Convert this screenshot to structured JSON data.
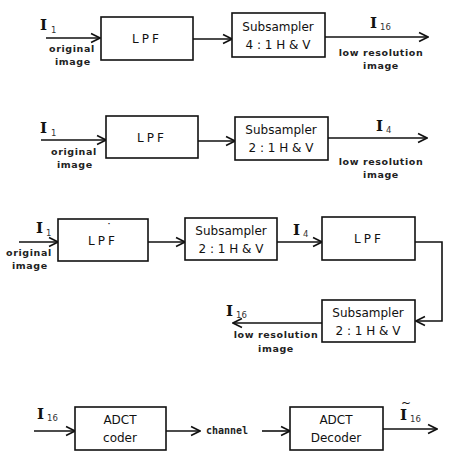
{
  "figure": {
    "rows": [
      {
        "id": "pipeline-4to1",
        "input": {
          "symbol": "I",
          "subscript": "1",
          "caption_line1": "original",
          "caption_line2": "image"
        },
        "blocks": [
          {
            "id": "lpf",
            "line1": "LPF"
          },
          {
            "id": "subsampler",
            "line1": "Subsampler",
            "line2": "4 : 1 H & V"
          }
        ],
        "output": {
          "symbol": "I",
          "subscript": "16",
          "caption_line1": "low resolution",
          "caption_line2": "image"
        }
      },
      {
        "id": "pipeline-2to1",
        "input": {
          "symbol": "I",
          "subscript": "1",
          "caption_line1": "original",
          "caption_line2": "image"
        },
        "blocks": [
          {
            "id": "lpf",
            "line1": "LPF"
          },
          {
            "id": "subsampler",
            "line1": "Subsampler",
            "line2": "2 : 1 H & V"
          }
        ],
        "output": {
          "symbol": "I",
          "subscript": "4",
          "caption_line1": "low resolution",
          "caption_line2": "image"
        }
      },
      {
        "id": "pipeline-cascade",
        "input": {
          "symbol": "I",
          "subscript": "1",
          "caption_line1": "original",
          "caption_line2": "image"
        },
        "blocks": [
          {
            "id": "lpf-prime",
            "line1": "LPF",
            "mark": "˙"
          },
          {
            "id": "subsampler-1",
            "line1": "Subsampler",
            "line2": "2 : 1 H & V"
          },
          {
            "id": "lpf-2",
            "line1": "LPF"
          },
          {
            "id": "subsampler-2",
            "line1": "Subsampler",
            "line2": "2 : 1 H & V"
          }
        ],
        "intermediate": {
          "symbol": "I",
          "subscript": "4"
        },
        "output": {
          "symbol": "I",
          "subscript": "16",
          "caption_line1": "low resolution",
          "caption_line2": "image"
        }
      },
      {
        "id": "coding-chain",
        "input": {
          "symbol": "I",
          "subscript": "16"
        },
        "blocks": [
          {
            "id": "adct-coder",
            "line1": "ADCT",
            "line2": "coder"
          },
          {
            "id": "adct-decoder",
            "line1": "ADCT",
            "line2": "Decoder"
          }
        ],
        "link_label": "channel",
        "output": {
          "symbol": "I",
          "accent": "~",
          "subscript": "16"
        }
      }
    ]
  }
}
